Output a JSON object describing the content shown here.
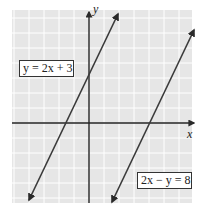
{
  "chart_data": {
    "type": "line",
    "title": "",
    "xlabel": "x",
    "ylabel": "y",
    "xlim": [
      -5,
      7
    ],
    "ylim": [
      -5.3,
      7.5
    ],
    "grid": true,
    "series": [
      {
        "name": "y = 2x + 3",
        "equation": "y = 2x + 3",
        "slope": 2,
        "intercept": 3,
        "x_intercept": -1.5,
        "y_intercept": 3,
        "x": [
          -4,
          2
        ],
        "y": [
          -5,
          7
        ]
      },
      {
        "name": "2x − y = 8",
        "equation": "2x - y = 8",
        "slope": 2,
        "intercept": -8,
        "x_intercept": 4,
        "y_intercept": -8,
        "x": [
          1.5,
          6.4
        ],
        "y": [
          -5,
          4.8
        ]
      }
    ],
    "annotations": [
      "y = 2x + 3",
      "2x − y = 8"
    ]
  },
  "labels": {
    "line1": "y = 2x + 3",
    "line2": "2x − y = 8",
    "x_axis": "x",
    "y_axis": "y"
  },
  "colors": {
    "grid_bg": "#e6e6e6",
    "grid_line": "#ffffff",
    "axis": "#222222",
    "line": "#3a3a3a"
  }
}
